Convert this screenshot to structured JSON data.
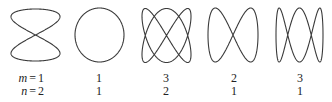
{
  "figure": {
    "row_labels": {
      "m": "m",
      "n": "n",
      "equals": "="
    },
    "stroke_color": "#3a3a3a",
    "text_color": "#222222",
    "figures": [
      {
        "m": 1,
        "n": 2,
        "x_freq": 2,
        "x_phase": 0,
        "y_freq": 1,
        "y_phase": 0,
        "shape": "vertical figure-eight",
        "m_label": "1",
        "n_label": "2"
      },
      {
        "m": 1,
        "n": 1,
        "x_freq": 1,
        "x_phase": 1.5708,
        "y_freq": 1,
        "y_phase": 0,
        "shape": "circle",
        "m_label": "1",
        "n_label": "1"
      },
      {
        "m": 3,
        "n": 2,
        "x_freq": 2,
        "x_phase": 0,
        "y_freq": 3,
        "y_phase": 0,
        "shape": "3:2 lissajous",
        "m_label": "3",
        "n_label": "2"
      },
      {
        "m": 2,
        "n": 1,
        "x_freq": 1,
        "x_phase": 0,
        "y_freq": 2,
        "y_phase": 0,
        "shape": "horizontal figure-eight",
        "m_label": "2",
        "n_label": "1"
      },
      {
        "m": 3,
        "n": 1,
        "x_freq": 1,
        "x_phase": 0,
        "y_freq": 3,
        "y_phase": 1.5708,
        "shape": "three lobes",
        "m_label": "3",
        "n_label": "1"
      }
    ]
  }
}
